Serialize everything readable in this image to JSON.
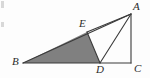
{
  "figure": {
    "background_color": "#fdfdfd",
    "stroke_color": "#3a3a3a",
    "shade_color": "#808080",
    "label_color": "#2b2b2b",
    "canvas": {
      "width": 150,
      "height": 78
    },
    "points": [
      {
        "id": "A",
        "label": "A",
        "x": 131,
        "y": 14,
        "label_x": 133,
        "label_y": 1
      },
      {
        "id": "B",
        "label": "B",
        "x": 23,
        "y": 63,
        "label_x": 12,
        "label_y": 56
      },
      {
        "id": "C",
        "label": "C",
        "x": 131,
        "y": 63,
        "label_x": 134,
        "label_y": 63
      },
      {
        "id": "D",
        "label": "D",
        "x": 100,
        "y": 63,
        "label_x": 96,
        "label_y": 64
      },
      {
        "id": "E",
        "label": "E",
        "x": 87,
        "y": 32,
        "label_x": 79,
        "label_y": 18
      }
    ],
    "segments": [
      {
        "name": "segment-BC",
        "from": "B",
        "to": "C"
      },
      {
        "name": "segment-AC",
        "from": "A",
        "to": "C"
      },
      {
        "name": "segment-BA",
        "from": "B",
        "to": "A"
      },
      {
        "name": "segment-AE",
        "from": "A",
        "to": "E"
      },
      {
        "name": "segment-AD",
        "from": "A",
        "to": "D"
      },
      {
        "name": "segment-ED",
        "from": "E",
        "to": "D"
      }
    ],
    "shaded_region": {
      "name": "triangle-BED",
      "vertices": [
        "B",
        "E",
        "D"
      ],
      "fill": "#808080"
    }
  }
}
